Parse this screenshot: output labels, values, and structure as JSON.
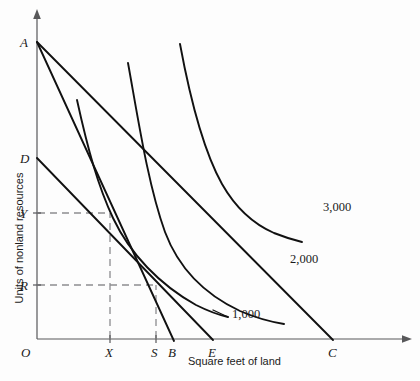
{
  "figure": {
    "type": "isoquant-isocost-diagram",
    "axes": {
      "x_title": "Square feet of land",
      "y_title": "Units of nonland resources",
      "origin_label": "O"
    },
    "y_axis_points": [
      {
        "label": "A",
        "x": 37,
        "y": 42
      },
      {
        "label": "D",
        "x": 37,
        "y": 158
      },
      {
        "label": "Y",
        "x": 37,
        "y": 213
      },
      {
        "label": "R",
        "x": 37,
        "y": 285
      }
    ],
    "x_axis_points": [
      {
        "label": "X",
        "x": 110,
        "y": 339
      },
      {
        "label": "S",
        "x": 156,
        "y": 339
      },
      {
        "label": "B",
        "x": 172,
        "y": 339
      },
      {
        "label": "E",
        "x": 212,
        "y": 339
      },
      {
        "label": "C",
        "x": 332,
        "y": 339
      }
    ],
    "isoquants": [
      {
        "label": "1,000",
        "label_x": 232,
        "label_y": 314
      },
      {
        "label": "2,000",
        "label_x": 290,
        "label_y": 259
      },
      {
        "label": "3,000",
        "label_x": 323,
        "label_y": 207
      }
    ],
    "isocost_lines": [
      {
        "name": "A-to-B",
        "from": "A",
        "to": "B"
      },
      {
        "name": "A-to-C",
        "from": "A",
        "to": "C"
      },
      {
        "name": "D-to-E",
        "from": "D",
        "to": "E"
      }
    ],
    "tangency_points": [
      {
        "name": "X-Y",
        "x_label": "X",
        "y_label": "Y"
      },
      {
        "name": "S-R",
        "x_label": "S",
        "y_label": "R"
      }
    ],
    "colors": {
      "curve": "#111111",
      "axis": "#58585a",
      "guide": "#8d8d90",
      "background": "#fdfdfd"
    }
  }
}
